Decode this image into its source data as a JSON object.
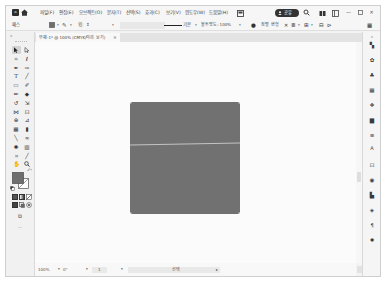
{
  "titlebar": {
    "logo": "Ai",
    "menu": [
      "파일(F)",
      "편집(E)",
      "오브젝트(O)",
      "문자(T)",
      "선택(S)",
      "효과(C)",
      "보기(V)",
      "윈도우(W)",
      "도움말(H)"
    ],
    "share_label": "공유",
    "window_controls": {
      "minimize": "—",
      "close": "✕"
    }
  },
  "control_bar": {
    "selection_type": "패스",
    "fill_color": "#6f6f6f",
    "dropdown": "▾",
    "stroke_label": "획:",
    "stroke_stepper": "⇕",
    "brush_definition": "기본",
    "opacity": "불투명도: 100%",
    "recolor_icon": "●",
    "align_link": "정렬",
    "transform_link": "변형",
    "isolate_icon": "✕",
    "align_icons": [
      "≣",
      "⊞",
      "⊟",
      "⊳"
    ],
    "panel_menu_icon": "▦"
  },
  "document_tab": {
    "title": "무제-1* @ 100% (CMYK/미리 보기)",
    "close": "×"
  },
  "toolbar": {
    "collapse": "«",
    "tools": [
      {
        "name": "selection"
      },
      {
        "name": "direct-selection"
      },
      {
        "name": "magic-wand",
        "glyph": "✧"
      },
      {
        "name": "lasso",
        "glyph": "ℓ"
      },
      {
        "name": "pen",
        "glyph": "✒"
      },
      {
        "name": "curvature",
        "glyph": "✑"
      },
      {
        "name": "type",
        "glyph": "T"
      },
      {
        "name": "line-segment",
        "glyph": "╱"
      },
      {
        "name": "rectangle",
        "glyph": "▭"
      },
      {
        "name": "paintbrush",
        "glyph": "✐"
      },
      {
        "name": "pencil",
        "glyph": "✏"
      },
      {
        "name": "shaper",
        "glyph": "◆"
      },
      {
        "name": "rotate",
        "glyph": "↺"
      },
      {
        "name": "scale",
        "glyph": "⇲"
      },
      {
        "name": "width",
        "glyph": "⋈"
      },
      {
        "name": "free-transform",
        "glyph": "⊡"
      },
      {
        "name": "shape-builder",
        "glyph": "⊕"
      },
      {
        "name": "perspective-grid",
        "glyph": "⊿"
      },
      {
        "name": "mesh",
        "glyph": "▦"
      },
      {
        "name": "gradient",
        "glyph": "▮"
      },
      {
        "name": "eyedropper",
        "glyph": "╲"
      },
      {
        "name": "blend",
        "glyph": "∞"
      },
      {
        "name": "symbol-sprayer",
        "glyph": "✺"
      },
      {
        "name": "column-graph",
        "glyph": "▥"
      },
      {
        "name": "artboard",
        "glyph": "⌗"
      },
      {
        "name": "slice",
        "glyph": "╱"
      },
      {
        "name": "hand",
        "glyph": "✋"
      },
      {
        "name": "zoom"
      }
    ],
    "fill_color": "#6f6f6f",
    "swap_icon": "⤺",
    "screen_mode_icon": "⧉",
    "more": "···"
  },
  "right_panel": {
    "collapse": "»",
    "panels": [
      {
        "name": "properties",
        "glyph": "▚"
      },
      {
        "name": "libraries",
        "glyph": "✿"
      },
      {
        "name": "symbols",
        "glyph": "♣"
      },
      {
        "name": "swatches",
        "glyph": "▦"
      },
      {
        "name": "brushes",
        "glyph": "❖"
      },
      {
        "name": "gradient",
        "glyph": "▆"
      },
      {
        "name": "stroke",
        "glyph": "≡"
      },
      {
        "name": "character",
        "glyph": "A"
      },
      {
        "name": "transform",
        "glyph": "⊡"
      },
      {
        "name": "appearance",
        "glyph": "◉"
      },
      {
        "name": "align",
        "glyph": "▙"
      },
      {
        "name": "layers",
        "glyph": "◈"
      },
      {
        "name": "paragraph",
        "glyph": "¶"
      },
      {
        "name": "color",
        "glyph": "✹"
      }
    ]
  },
  "artboard": {
    "fill": "#717171",
    "guide_line_color": "#d9d9d9"
  },
  "status_bar": {
    "zoom": "100%",
    "rotation": "0°",
    "artboard_number": "1",
    "status": "선택",
    "status_arrow": "▸",
    "dropdown": "▾"
  }
}
